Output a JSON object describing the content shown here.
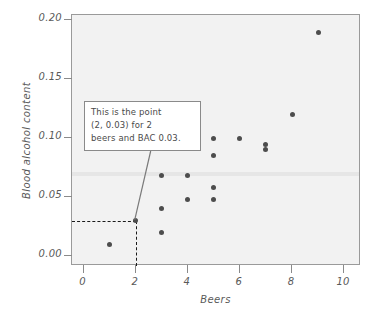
{
  "chart_data": {
    "type": "scatter",
    "title": "",
    "xlabel": "Beers",
    "ylabel": "Blood alcohol content",
    "xlim": [
      -0.45,
      10.65
    ],
    "ylim": [
      -0.0085,
      0.2045
    ],
    "xticks": [
      "0",
      "2",
      "4",
      "6",
      "8",
      "10"
    ],
    "xtick_values": [
      0,
      2,
      4,
      6,
      8,
      10
    ],
    "yticks": [
      "0.00",
      "0.05",
      "0.10",
      "0.15",
      "0.20"
    ],
    "ytick_values": [
      0.0,
      0.05,
      0.1,
      0.15,
      0.2
    ],
    "grid": false,
    "legend": "none",
    "marker_color": "#4d4d4d",
    "panel_color": "#f2f2f2",
    "points": [
      {
        "x": 1,
        "y": 0.01
      },
      {
        "x": 2,
        "y": 0.03
      },
      {
        "x": 3,
        "y": 0.02
      },
      {
        "x": 3,
        "y": 0.04
      },
      {
        "x": 3,
        "y": 0.068
      },
      {
        "x": 4,
        "y": 0.048
      },
      {
        "x": 4,
        "y": 0.068
      },
      {
        "x": 5,
        "y": 0.048
      },
      {
        "x": 5,
        "y": 0.058
      },
      {
        "x": 5,
        "y": 0.085
      },
      {
        "x": 5,
        "y": 0.1
      },
      {
        "x": 6,
        "y": 0.1
      },
      {
        "x": 7,
        "y": 0.09
      },
      {
        "x": 7,
        "y": 0.095
      },
      {
        "x": 8,
        "y": 0.12
      },
      {
        "x": 9,
        "y": 0.19
      }
    ],
    "annotations": [
      {
        "name": "highlighted-point",
        "lines": [
          "This is the point",
          "(2, 0.03) for 2",
          "beers and BAC 0.03."
        ],
        "target_x": 2,
        "target_y": 0.03
      }
    ],
    "guide_lines": [
      {
        "orientation": "horizontal",
        "value": 0.03,
        "style": "dashed",
        "from_x": -0.45,
        "to_x": 2
      },
      {
        "orientation": "vertical",
        "value": 2,
        "style": "dashed",
        "from_y": -0.0085,
        "to_y": 0.03
      }
    ],
    "band": {
      "from_y": 0.068,
      "to_y": 0.0715,
      "color": "#e6e6e6"
    }
  }
}
